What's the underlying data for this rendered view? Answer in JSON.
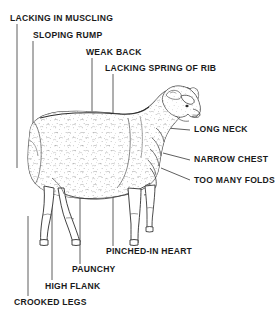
{
  "diagram": {
    "orientation": "facing-right",
    "colors": {
      "ink": "#1a1a1a",
      "leader_line": "#4d4d4d",
      "background": "#ffffff",
      "fleece_fill": "#ffffff"
    },
    "labels": [
      {
        "id": "lacking-in-muscling",
        "text": "LACKING IN MUSCLING",
        "x": 10,
        "y": 13,
        "side": "top-left",
        "leader": "vertical"
      },
      {
        "id": "sloping-rump",
        "text": "SLOPING RUMP",
        "x": 33,
        "y": 30,
        "side": "top-left",
        "leader": "vertical"
      },
      {
        "id": "weak-back",
        "text": "WEAK BACK",
        "x": 86,
        "y": 47,
        "side": "top",
        "leader": "vertical"
      },
      {
        "id": "lacking-spring-of-rib",
        "text": "LACKING SPRING OF RIB",
        "x": 105,
        "y": 63,
        "side": "top",
        "leader": "vertical"
      },
      {
        "id": "long-neck",
        "text": "LONG NECK",
        "x": 194,
        "y": 127,
        "side": "right",
        "leader": "horizontal"
      },
      {
        "id": "narrow-chest",
        "text": "NARROW CHEST",
        "x": 194,
        "y": 157,
        "side": "right",
        "leader": "horizontal"
      },
      {
        "id": "too-many-folds",
        "text": "TOO MANY FOLDS",
        "x": 194,
        "y": 177,
        "side": "right",
        "leader": "horizontal"
      },
      {
        "id": "pinched-in-heart",
        "text": "PINCHED-IN HEART",
        "x": 106,
        "y": 249,
        "side": "bottom",
        "leader": "vertical"
      },
      {
        "id": "paunchy",
        "text": "PAUNCHY",
        "x": 72,
        "y": 267,
        "side": "bottom",
        "leader": "vertical"
      },
      {
        "id": "high-flank",
        "text": "HIGH FLANK",
        "x": 45,
        "y": 283,
        "side": "bottom",
        "leader": "vertical"
      },
      {
        "id": "crooked-legs",
        "text": "CROOKED LEGS",
        "x": 14,
        "y": 299,
        "side": "bottom",
        "leader": "vertical"
      }
    ]
  }
}
